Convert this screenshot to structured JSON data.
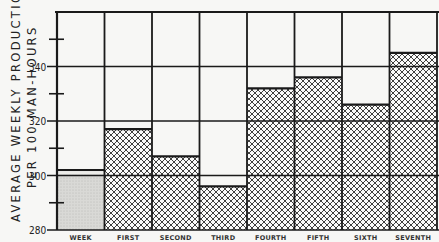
{
  "chart_data": {
    "type": "bar",
    "title": "",
    "ylabel_lines": [
      "AVERAGE  WEEKLY  PRODUCTION",
      "PER  100  MAN-HOURS"
    ],
    "xlabel": "",
    "categories": [
      "WEEK",
      "FIRST",
      "SECOND",
      "THIRD",
      "FOURTH",
      "FIFTH",
      "SIXTH",
      "SEVENTH"
    ],
    "values": [
      302,
      317,
      307,
      296,
      332,
      336,
      326,
      345
    ],
    "ylim": [
      280,
      360
    ],
    "yticks_major": [
      280,
      300,
      320,
      340
    ],
    "yticks_minor": [
      290,
      310,
      330,
      350
    ],
    "ytick_labels": [
      "280",
      "300",
      "320",
      "340"
    ],
    "grid": true,
    "fills": [
      "stipple",
      "crosshatch",
      "crosshatch",
      "crosshatch",
      "crosshatch",
      "crosshatch",
      "crosshatch",
      "crosshatch"
    ],
    "note": "First bar (base week) drawn with light stipple; subsequent weeks cross-hatched. Chart cropped at right edge."
  },
  "colors": {
    "background": "#f7f7f5",
    "ink": "#1a1a1a",
    "stipple": "#d9d9d6"
  }
}
